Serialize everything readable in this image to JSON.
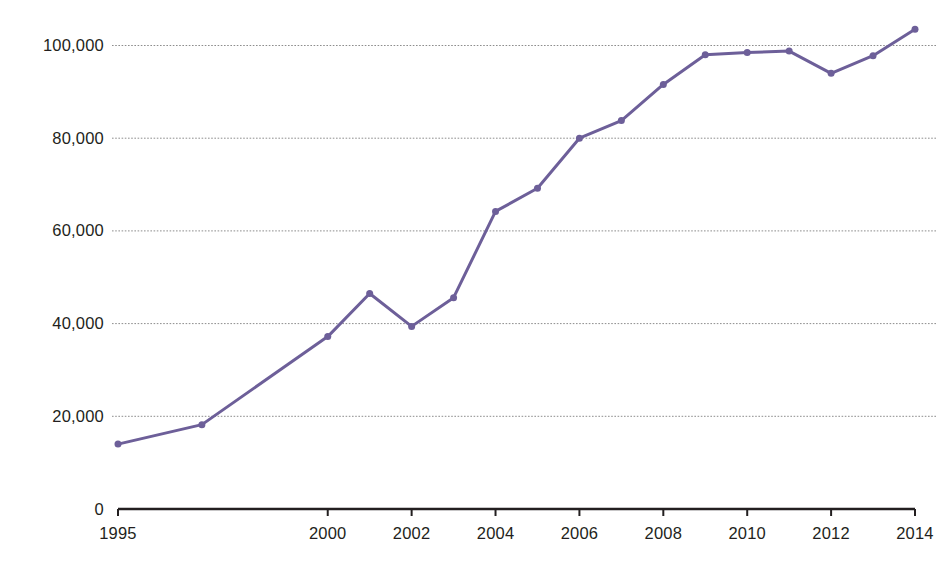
{
  "chart_data": {
    "type": "line",
    "title": "",
    "xlabel": "",
    "ylabel": "",
    "x": [
      1995,
      1997,
      2000,
      2001,
      2002,
      2003,
      2004,
      2005,
      2006,
      2007,
      2008,
      2009,
      2010,
      2011,
      2012,
      2013,
      2014
    ],
    "values": [
      14000,
      18200,
      37200,
      46500,
      39400,
      45600,
      64200,
      69200,
      80000,
      83800,
      91600,
      98000,
      98500,
      98800,
      94000,
      97800,
      103500
    ],
    "series": [
      {
        "name": "series-1",
        "color": "#6d5f99",
        "values": [
          14000,
          18200,
          37200,
          46500,
          39400,
          45600,
          64200,
          69200,
          80000,
          83800,
          91600,
          98000,
          98500,
          98800,
          94000,
          97800,
          103500
        ]
      }
    ],
    "xlim": [
      1995,
      2014
    ],
    "ylim": [
      0,
      110000
    ],
    "x_ticks": [
      1995,
      2000,
      2002,
      2004,
      2006,
      2008,
      2010,
      2012,
      2014
    ],
    "x_tick_labels": [
      "1995",
      "2000",
      "2002",
      "2004",
      "2006",
      "2008",
      "2010",
      "2012",
      "2014"
    ],
    "y_ticks": [
      0,
      20000,
      40000,
      60000,
      80000,
      100000
    ],
    "y_tick_labels": [
      "0",
      "20,000",
      "40,000",
      "60,000",
      "80,000",
      "100,000"
    ],
    "gridlines": {
      "horizontal": true,
      "vertical": false,
      "values": [
        20000,
        40000,
        60000,
        80000,
        100000
      ],
      "style": "dotted",
      "color": "#8d8d8d"
    },
    "legend": null,
    "marker": "circle",
    "marker_size": 7,
    "line_width": 3,
    "axis_color": "#231f20",
    "text_color": "#231f20",
    "background": "#ffffff"
  }
}
